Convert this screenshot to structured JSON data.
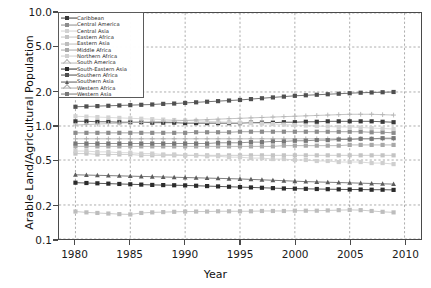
{
  "chart_data": {
    "type": "line",
    "title": "",
    "xlabel": "Year",
    "ylabel": "Arable Land/Agricultural Population",
    "yscale": "log",
    "ylim": [
      0.1,
      10.0
    ],
    "xlim": [
      1978.5,
      2011.5
    ],
    "yticks": [
      10.0,
      5.0,
      2.0,
      1.0,
      0.5,
      0.2,
      0.1
    ],
    "ytick_labels": [
      "10.0",
      "5.0",
      "2.0",
      "1.0",
      "0.5",
      "0.2",
      "0.1"
    ],
    "xticks": [
      1980,
      1985,
      1990,
      1995,
      2000,
      2005,
      2010
    ],
    "xtick_labels": [
      "1980",
      "1985",
      "1990",
      "1995",
      "2000",
      "2005",
      "2010"
    ],
    "grid": true,
    "grid_style": "dotted",
    "legend_position": "upper left",
    "x": [
      1980,
      1981,
      1982,
      1983,
      1984,
      1985,
      1986,
      1987,
      1988,
      1989,
      1990,
      1991,
      1992,
      1993,
      1994,
      1995,
      1996,
      1997,
      1998,
      1999,
      2000,
      2001,
      2002,
      2003,
      2004,
      2005,
      2006,
      2007,
      2008,
      2009
    ],
    "series": [
      {
        "name": "Caribbean",
        "marker": "square",
        "color": "#3a3a3a",
        "values": [
          1.1,
          1.1,
          1.09,
          1.09,
          1.08,
          1.08,
          1.08,
          1.07,
          1.07,
          1.07,
          1.06,
          1.06,
          1.06,
          1.06,
          1.06,
          1.06,
          1.07,
          1.07,
          1.07,
          1.08,
          1.08,
          1.09,
          1.09,
          1.1,
          1.1,
          1.1,
          1.1,
          1.1,
          1.09,
          1.08
        ]
      },
      {
        "name": "Central America",
        "marker": "square",
        "color": "#8c8c8c",
        "values": [
          0.87,
          0.87,
          0.87,
          0.87,
          0.87,
          0.87,
          0.87,
          0.87,
          0.87,
          0.87,
          0.87,
          0.88,
          0.88,
          0.88,
          0.88,
          0.89,
          0.89,
          0.89,
          0.89,
          0.89,
          0.89,
          0.89,
          0.89,
          0.89,
          0.89,
          0.89,
          0.89,
          0.88,
          0.88,
          0.87
        ]
      },
      {
        "name": "Central Asia",
        "marker": "square",
        "color": "#d2d2d2",
        "values": [
          1.22,
          1.21,
          1.2,
          1.19,
          1.18,
          1.17,
          1.16,
          1.15,
          1.14,
          1.13,
          1.12,
          1.11,
          1.1,
          1.09,
          1.08,
          1.07,
          1.06,
          1.05,
          1.04,
          1.03,
          1.02,
          1.01,
          1.0,
          0.99,
          0.98,
          0.98,
          0.97,
          0.96,
          0.95,
          0.94
        ]
      },
      {
        "name": "Eastern Africa",
        "marker": "square",
        "color": "#c4c4c4",
        "values": [
          0.57,
          0.57,
          0.56,
          0.56,
          0.56,
          0.56,
          0.55,
          0.55,
          0.55,
          0.55,
          0.55,
          0.55,
          0.55,
          0.55,
          0.55,
          0.55,
          0.55,
          0.55,
          0.55,
          0.55,
          0.55,
          0.55,
          0.55,
          0.55,
          0.55,
          0.55,
          0.55,
          0.55,
          0.55,
          0.55
        ]
      },
      {
        "name": "Eastern Asia",
        "marker": "square",
        "color": "#bdbdbd",
        "values": [
          0.175,
          0.172,
          0.17,
          0.168,
          0.166,
          0.165,
          0.17,
          0.172,
          0.173,
          0.174,
          0.175,
          0.175,
          0.175,
          0.176,
          0.176,
          0.176,
          0.176,
          0.177,
          0.177,
          0.177,
          0.178,
          0.178,
          0.178,
          0.179,
          0.18,
          0.181,
          0.18,
          0.177,
          0.174,
          0.172
        ]
      },
      {
        "name": "Middle Africa",
        "marker": "square",
        "color": "#a8a8a8",
        "values": [
          0.66,
          0.66,
          0.66,
          0.66,
          0.66,
          0.66,
          0.66,
          0.66,
          0.66,
          0.66,
          0.66,
          0.66,
          0.66,
          0.66,
          0.66,
          0.66,
          0.66,
          0.66,
          0.66,
          0.67,
          0.67,
          0.67,
          0.67,
          0.67,
          0.67,
          0.68,
          0.68,
          0.68,
          0.68,
          0.68
        ]
      },
      {
        "name": "Northern Africa",
        "marker": "square",
        "color": "#cfcfcf",
        "values": [
          0.6,
          0.6,
          0.59,
          0.59,
          0.58,
          0.58,
          0.57,
          0.57,
          0.56,
          0.56,
          0.55,
          0.55,
          0.54,
          0.54,
          0.53,
          0.53,
          0.52,
          0.52,
          0.51,
          0.51,
          0.5,
          0.5,
          0.49,
          0.49,
          0.48,
          0.48,
          0.48,
          0.47,
          0.47,
          0.46
        ]
      },
      {
        "name": "South America",
        "marker": "plus",
        "color": "#b5b5b5",
        "values": [
          1.02,
          1.03,
          1.04,
          1.05,
          1.06,
          1.07,
          1.08,
          1.09,
          1.1,
          1.11,
          1.12,
          1.13,
          1.14,
          1.15,
          1.16,
          1.17,
          1.18,
          1.19,
          1.2,
          1.21,
          1.22,
          1.23,
          1.24,
          1.25,
          1.26,
          1.27,
          1.27,
          1.27,
          1.26,
          1.25
        ]
      },
      {
        "name": "South-Eastern Asia",
        "marker": "square",
        "color": "#2b2b2b",
        "values": [
          0.315,
          0.313,
          0.311,
          0.309,
          0.307,
          0.305,
          0.303,
          0.301,
          0.3,
          0.299,
          0.298,
          0.296,
          0.294,
          0.292,
          0.29,
          0.288,
          0.286,
          0.284,
          0.282,
          0.28,
          0.279,
          0.278,
          0.277,
          0.276,
          0.275,
          0.274,
          0.274,
          0.273,
          0.273,
          0.272
        ]
      },
      {
        "name": "Southern Africa",
        "marker": "square",
        "color": "#4f4f4f",
        "values": [
          1.48,
          1.49,
          1.5,
          1.51,
          1.52,
          1.53,
          1.54,
          1.55,
          1.57,
          1.58,
          1.6,
          1.62,
          1.64,
          1.66,
          1.68,
          1.7,
          1.73,
          1.76,
          1.79,
          1.82,
          1.85,
          1.87,
          1.89,
          1.91,
          1.93,
          1.95,
          1.97,
          1.98,
          1.99,
          2.0
        ]
      },
      {
        "name": "Southern Asia",
        "marker": "triangle",
        "color": "#5c5c5c",
        "values": [
          0.37,
          0.368,
          0.366,
          0.364,
          0.362,
          0.36,
          0.358,
          0.356,
          0.354,
          0.352,
          0.35,
          0.348,
          0.346,
          0.344,
          0.342,
          0.34,
          0.337,
          0.334,
          0.331,
          0.328,
          0.325,
          0.322,
          0.32,
          0.318,
          0.316,
          0.314,
          0.312,
          0.31,
          0.308,
          0.306
        ]
      },
      {
        "name": "Western Africa",
        "marker": "plus",
        "color": "#aaaaaa",
        "values": [
          0.77,
          0.77,
          0.77,
          0.77,
          0.77,
          0.77,
          0.77,
          0.77,
          0.77,
          0.77,
          0.77,
          0.77,
          0.77,
          0.77,
          0.77,
          0.77,
          0.77,
          0.77,
          0.77,
          0.77,
          0.77,
          0.77,
          0.77,
          0.77,
          0.77,
          0.77,
          0.77,
          0.77,
          0.77,
          0.77
        ]
      },
      {
        "name": "Western Asia",
        "marker": "square",
        "color": "#787878",
        "values": [
          0.7,
          0.7,
          0.7,
          0.7,
          0.7,
          0.7,
          0.7,
          0.7,
          0.7,
          0.7,
          0.7,
          0.7,
          0.7,
          0.71,
          0.71,
          0.71,
          0.72,
          0.72,
          0.73,
          0.73,
          0.74,
          0.74,
          0.75,
          0.75,
          0.76,
          0.76,
          0.77,
          0.77,
          0.78,
          0.78
        ]
      }
    ]
  }
}
